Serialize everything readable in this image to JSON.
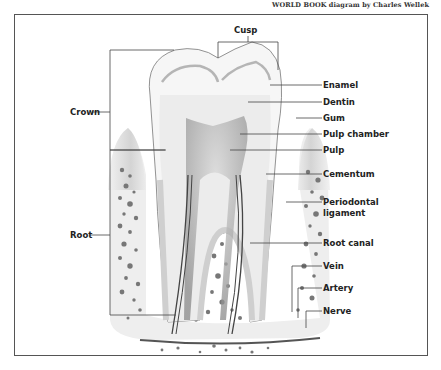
{
  "credit": "WORLD BOOK diagram by Charles Wellek",
  "labels": {
    "cusp": "Cusp",
    "crown": "Crown",
    "root": "Root",
    "enamel": "Enamel",
    "dentin": "Dentin",
    "gum": "Gum",
    "pulp_chamber": "Pulp chamber",
    "pulp": "Pulp",
    "cementum": "Cementum",
    "periodontal_ligament_line1": "Periodontal",
    "periodontal_ligament_line2": "ligament",
    "root_canal": "Root canal",
    "vein": "Vein",
    "artery": "Artery",
    "nerve": "Nerve"
  },
  "colors": {
    "outline": "#555555",
    "bone": "#e4e4e4",
    "gum": "#d8d8d8",
    "enamel": "#f4f4f4",
    "dentin": "#ececec",
    "pulp": "#bdbdbd",
    "leader": "#444444"
  }
}
